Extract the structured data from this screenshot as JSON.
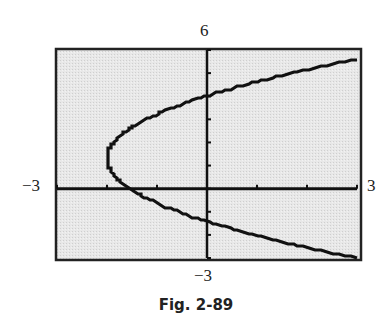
{
  "chart_data": {
    "type": "line",
    "title": "",
    "caption": "Fig. 2-89",
    "xlabel": "",
    "ylabel": "",
    "xlim": [
      -3,
      3
    ],
    "ylim": [
      -3,
      6
    ],
    "window_labels": {
      "ymax": "6",
      "ymin": "−3",
      "xmin": "−3",
      "xmax": "3"
    },
    "grid": false,
    "x_ticks": [
      -3,
      -2,
      -1,
      0,
      1,
      2,
      3
    ],
    "y_ticks": [
      -3,
      -2,
      -1,
      0,
      1,
      2,
      3,
      4,
      5,
      6
    ],
    "series": [
      {
        "name": "sideways parabola",
        "description": "Parabola opening right, vertex near (-2, 1.3), crossing y-axis near y = 4.0 and y = -1.4",
        "equation": "x = 0.27*(y - 1.3)^2 - 2",
        "points": [
          {
            "x": 3.0,
            "y": 5.6
          },
          {
            "x": 2.0,
            "y": 5.1
          },
          {
            "x": 1.0,
            "y": 4.6
          },
          {
            "x": 0.0,
            "y": 4.0
          },
          {
            "x": -1.0,
            "y": 3.2
          },
          {
            "x": -1.5,
            "y": 2.7
          },
          {
            "x": -2.0,
            "y": 1.3
          },
          {
            "x": -1.5,
            "y": -0.1
          },
          {
            "x": -1.0,
            "y": -0.6
          },
          {
            "x": 0.0,
            "y": -1.4
          },
          {
            "x": 1.0,
            "y": -2.0
          },
          {
            "x": 2.0,
            "y": -2.5
          },
          {
            "x": 3.0,
            "y": -3.0
          }
        ]
      }
    ]
  },
  "colors": {
    "background": "#e6e6e6",
    "ink": "#111111",
    "frame": "#222222"
  }
}
